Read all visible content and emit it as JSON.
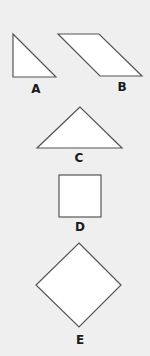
{
  "figure": {
    "shapes": [
      {
        "id": "A",
        "label": "A",
        "kind": "right-triangle"
      },
      {
        "id": "B",
        "label": "B",
        "kind": "parallelogram"
      },
      {
        "id": "C",
        "label": "C",
        "kind": "isosceles-triangle"
      },
      {
        "id": "D",
        "label": "D",
        "kind": "square"
      },
      {
        "id": "E",
        "label": "E",
        "kind": "rhombus-diamond"
      }
    ]
  },
  "colors": {
    "background": "#efefef",
    "shape_fill": "#ffffff",
    "shape_stroke": "#555555",
    "label": "#1a1a1a"
  }
}
